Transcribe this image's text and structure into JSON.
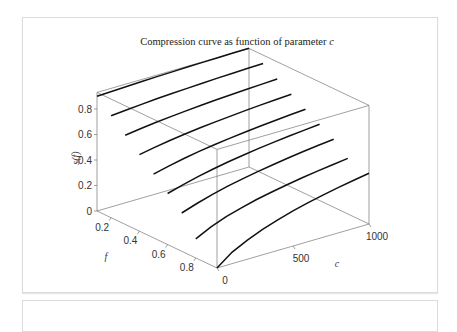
{
  "chart_data": {
    "type": "line",
    "projection": "3d",
    "title": "Compression curve as function of parameter c",
    "title_prefix": "Compression curve as function of parameter ",
    "title_var": "c",
    "xlabel": "f",
    "ylabel": "c",
    "zlabel": "s(f)",
    "xlim": [
      0.1,
      0.95
    ],
    "ylim": [
      0,
      1000
    ],
    "zlim": [
      0,
      0.93
    ],
    "x_ticks": [
      "0.2",
      "0.4",
      "0.6",
      "0.8"
    ],
    "x_tick_values": [
      0.2,
      0.4,
      0.6,
      0.8
    ],
    "y_ticks": [
      "0",
      "500",
      "1000"
    ],
    "y_tick_values": [
      0,
      500,
      1000
    ],
    "z_ticks": [
      "0",
      "0.2",
      "0.4",
      "0.6",
      "0.8"
    ],
    "z_tick_values": [
      0,
      0.2,
      0.4,
      0.6,
      0.8
    ],
    "grid": false,
    "c_samples": [
      0,
      100,
      200,
      300,
      400,
      500,
      600,
      700,
      800,
      900,
      1000
    ],
    "series": [
      {
        "name": "f=0.1",
        "f": 0.1,
        "values": [
          0.9,
          0.905,
          0.91,
          0.914,
          0.918,
          0.921,
          0.924,
          0.926,
          0.928,
          0.93,
          0.931
        ]
      },
      {
        "name": "f=0.2",
        "f": 0.2,
        "values": [
          0.8,
          0.81,
          0.82,
          0.83,
          0.836,
          0.842,
          0.848,
          0.853,
          0.857,
          0.861,
          0.864
        ]
      },
      {
        "name": "f=0.3",
        "f": 0.3,
        "values": [
          0.7,
          0.716,
          0.73,
          0.742,
          0.752,
          0.762,
          0.77,
          0.777,
          0.784,
          0.79,
          0.795
        ]
      },
      {
        "name": "f=0.4",
        "f": 0.4,
        "values": [
          0.6,
          0.622,
          0.642,
          0.658,
          0.672,
          0.684,
          0.695,
          0.705,
          0.714,
          0.722,
          0.729
        ]
      },
      {
        "name": "f=0.5",
        "f": 0.5,
        "values": [
          0.5,
          0.528,
          0.553,
          0.574,
          0.592,
          0.607,
          0.621,
          0.633,
          0.644,
          0.654,
          0.663
        ]
      },
      {
        "name": "f=0.6",
        "f": 0.6,
        "values": [
          0.4,
          0.434,
          0.464,
          0.489,
          0.511,
          0.53,
          0.547,
          0.562,
          0.575,
          0.587,
          0.598
        ]
      },
      {
        "name": "f=0.7",
        "f": 0.7,
        "values": [
          0.3,
          0.34,
          0.375,
          0.405,
          0.43,
          0.452,
          0.472,
          0.49,
          0.506,
          0.52,
          0.533
        ]
      },
      {
        "name": "f=0.8",
        "f": 0.8,
        "values": [
          0.15,
          0.21,
          0.255,
          0.29,
          0.32,
          0.345,
          0.367,
          0.387,
          0.405,
          0.421,
          0.436
        ]
      },
      {
        "name": "f=0.95",
        "f": 0.95,
        "values": [
          0.0,
          0.09,
          0.15,
          0.2,
          0.24,
          0.275,
          0.305,
          0.332,
          0.356,
          0.378,
          0.398
        ]
      }
    ]
  }
}
